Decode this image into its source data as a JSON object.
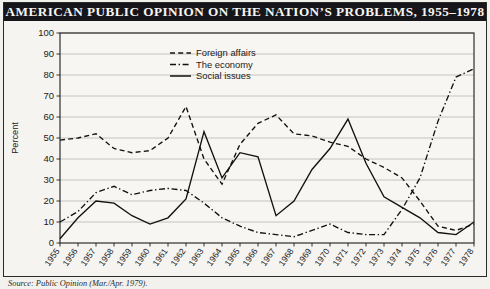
{
  "title": "AMERICAN PUBLIC OPINION ON THE NATION’S PROBLEMS, 1955–1978",
  "caption": "Source: Public Opinion (Mar./Apr. 1979).",
  "colors": {
    "title_bar": "#16161a",
    "title_text": "#f6f5f2",
    "page_background": "#f2f1ee",
    "plot_background": "#f5f4f1",
    "grid": "#b9b8b4",
    "axis": "#1d1d1b",
    "line": "#111111"
  },
  "legend": {
    "position": "top-center",
    "entries": [
      {
        "label": "Foreign affairs",
        "style": "dashed"
      },
      {
        "label": "The economy",
        "style": "dash-dot"
      },
      {
        "label": "Social issues",
        "style": "solid"
      }
    ]
  },
  "chart_data": {
    "type": "line",
    "title": "AMERICAN PUBLIC OPINION ON THE NATION’S PROBLEMS, 1955–1978",
    "xlabel": "",
    "ylabel": "Percent",
    "ylim": [
      0,
      100
    ],
    "yticks": [
      0,
      10,
      20,
      30,
      40,
      50,
      60,
      70,
      80,
      90,
      100
    ],
    "grid": true,
    "x": [
      1955,
      1956,
      1957,
      1958,
      1959,
      1960,
      1961,
      1962,
      1963,
      1964,
      1965,
      1966,
      1967,
      1968,
      1969,
      1970,
      1971,
      1972,
      1973,
      1974,
      1975,
      1976,
      1977,
      1978
    ],
    "categories": [
      "1955",
      "1956",
      "1957",
      "1958",
      "1959",
      "1960",
      "1961",
      "1962",
      "1963",
      "1964",
      "1965",
      "1966",
      "1967",
      "1968",
      "1969",
      "1970",
      "1971",
      "1972",
      "1973",
      "1974",
      "1975",
      "1976",
      "1977",
      "1978"
    ],
    "series": [
      {
        "name": "Foreign affairs",
        "style": "dashed",
        "values": [
          49,
          50,
          52,
          45,
          43,
          44,
          50,
          65,
          40,
          28,
          47,
          57,
          61,
          52,
          51,
          48,
          46,
          40,
          36,
          31,
          20,
          8,
          6,
          9
        ]
      },
      {
        "name": "The economy",
        "style": "dash-dot",
        "values": [
          10,
          15,
          24,
          27,
          23,
          25,
          26,
          25,
          19,
          12,
          8,
          5,
          4,
          3,
          6,
          9,
          5,
          4,
          4,
          16,
          31,
          58,
          79,
          83
        ]
      },
      {
        "name": "Social issues",
        "style": "solid",
        "values": [
          2,
          12,
          20,
          19,
          13,
          9,
          12,
          21,
          53,
          31,
          43,
          41,
          13,
          20,
          35,
          45,
          59,
          38,
          22,
          17,
          12,
          5,
          4,
          10
        ]
      }
    ]
  }
}
